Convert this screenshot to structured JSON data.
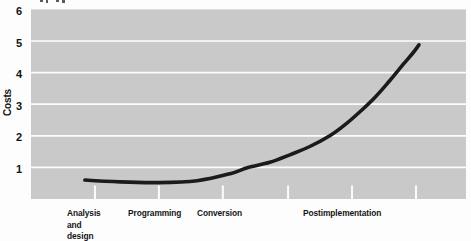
{
  "figure": {
    "ylabel": "Costs",
    "cropped_title_fragment": "illegible text cut off at top edge of image"
  },
  "chart_data": {
    "type": "line",
    "title": "",
    "xlabel": "",
    "ylabel": "Costs",
    "ylim": [
      0,
      6
    ],
    "y_ticks": [
      6,
      5,
      4,
      3,
      2,
      1
    ],
    "gridlines": [
      1,
      2,
      3,
      4,
      5
    ],
    "grid": "horizontal white lines on gray panel",
    "legend": "none",
    "categories": [
      "Analysis and design",
      "Programming",
      "Conversion",
      "Postimplementation"
    ],
    "category_label_lines": [
      [
        "Analysis",
        "and",
        "design"
      ],
      [
        "Programming"
      ],
      [
        "Conversion"
      ],
      [
        "Postimplementation"
      ]
    ],
    "x_tick_fracs": [
      0.147,
      0.294,
      0.441,
      0.591,
      0.738,
      0.885
    ],
    "series": [
      {
        "name": "Costs",
        "description": "Costs stay low (~0.5-0.6) through analysis and design, programming and conversion, then rise exponentially during postimplementation to ~4.9",
        "points": [
          {
            "x_frac": 0.124,
            "y": 0.6
          },
          {
            "x_frac": 0.205,
            "y": 0.54
          },
          {
            "x_frac": 0.294,
            "y": 0.52
          },
          {
            "x_frac": 0.382,
            "y": 0.58
          },
          {
            "x_frac": 0.458,
            "y": 0.8
          },
          {
            "x_frac": 0.499,
            "y": 1.0
          },
          {
            "x_frac": 0.549,
            "y": 1.16
          },
          {
            "x_frac": 0.595,
            "y": 1.4
          },
          {
            "x_frac": 0.641,
            "y": 1.66
          },
          {
            "x_frac": 0.687,
            "y": 2.0
          },
          {
            "x_frac": 0.722,
            "y": 2.35
          },
          {
            "x_frac": 0.756,
            "y": 2.76
          },
          {
            "x_frac": 0.791,
            "y": 3.22
          },
          {
            "x_frac": 0.825,
            "y": 3.75
          },
          {
            "x_frac": 0.855,
            "y": 4.25
          },
          {
            "x_frac": 0.878,
            "y": 4.62
          },
          {
            "x_frac": 0.892,
            "y": 4.88
          }
        ]
      }
    ],
    "colors": {
      "panel": "#c9c9c9",
      "gridline": "#fcfcfc",
      "curve": "#1b1b1b",
      "text": "#141414",
      "background": "#fdfdfd"
    }
  }
}
